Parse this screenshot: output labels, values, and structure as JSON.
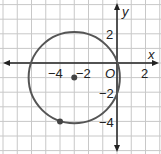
{
  "diagram": {
    "type": "coordinate-plane-circle",
    "axis_labels": {
      "x": "x",
      "y": "y",
      "origin": "O"
    },
    "ticks": {
      "x": [
        {
          "value": -4,
          "label": "−4"
        },
        {
          "value": -2,
          "label": "−2"
        },
        {
          "value": 2,
          "label": "2"
        }
      ],
      "y": [
        {
          "value": 2,
          "label": "2"
        },
        {
          "value": -2,
          "label": "−2"
        },
        {
          "value": -4,
          "label": "−4"
        }
      ]
    },
    "circle": {
      "center": [
        -3,
        -1
      ],
      "radius_squared": 10,
      "passes_through": [
        [
          0,
          0
        ],
        [
          -4,
          -4
        ]
      ]
    },
    "points": [
      {
        "name": "center",
        "coords": [
          -3,
          -1
        ]
      },
      {
        "name": "point-on-circle",
        "coords": [
          -4,
          -4
        ]
      }
    ],
    "colors": {
      "grid": "#c8c8c8",
      "axis": "#222222",
      "circle": "#555555",
      "point": "#444444",
      "background": "#ffffff"
    }
  }
}
